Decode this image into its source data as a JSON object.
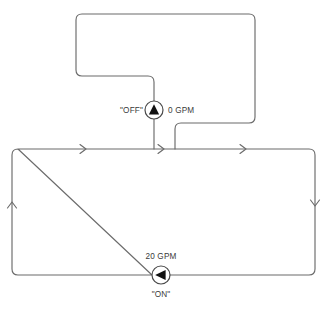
{
  "diagram": {
    "stroke_color": "#6b6b6b",
    "pump_fill_color": "#111111",
    "background_color": "#ffffff",
    "upper_pump": {
      "state_label": "\"OFF\"",
      "flow_label": "0 GPM",
      "symbol": "pump-triangle-up"
    },
    "lower_pump": {
      "state_label": "\"ON\"",
      "flow_label": "20 GPM",
      "symbol": "pump-triangle-left"
    },
    "flow_arrows": [
      {
        "name": "flow-arrow-top-left",
        "direction": "right"
      },
      {
        "name": "flow-arrow-top-middle",
        "direction": "right"
      },
      {
        "name": "flow-arrow-top-right",
        "direction": "right"
      },
      {
        "name": "flow-arrow-right-side",
        "direction": "down"
      },
      {
        "name": "flow-arrow-left-side",
        "direction": "up"
      }
    ]
  }
}
